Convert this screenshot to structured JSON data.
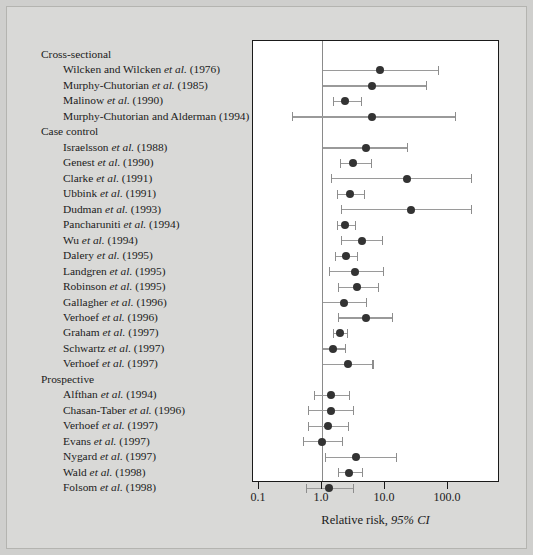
{
  "figure": {
    "background_color": "#d9d9d7",
    "panel_color": "#ffffff",
    "marker_color": "#333333",
    "whisker_color": "#9a9a9a"
  },
  "axis": {
    "title_main": "Relative risk, ",
    "title_italic": "95% CI",
    "ticks": [
      "0.1",
      "1.0",
      "10.0",
      "100.0"
    ],
    "tick_values": [
      0.1,
      1.0,
      10.0,
      100.0
    ],
    "null_value": 1.0
  },
  "chart_data": {
    "type": "scatter",
    "title": "",
    "xlabel": "Relative risk, 95% CI",
    "ylabel": "",
    "scale": "log",
    "xlim": [
      0.1,
      300
    ],
    "xticks": [
      0.1,
      1.0,
      10.0,
      100.0
    ],
    "xticklabels": [
      "0.1",
      "1.0",
      "10.0",
      "100.0"
    ],
    "grid": false,
    "reference_line": 1.0,
    "legend": "none",
    "groups": [
      {
        "name": "Cross-sectional",
        "studies": [
          {
            "label_plain": "Wilcken and Wilcken ",
            "label_italic": "et al.",
            "label_year": " (1976)",
            "estimate": 8.2,
            "ci_low": 1.0,
            "ci_high": 70.0
          },
          {
            "label_plain": "Murphy-Chutorian ",
            "label_italic": "et al.",
            "label_year": " (1985)",
            "estimate": 6.3,
            "ci_low": 1.0,
            "ci_high": 45.0
          },
          {
            "label_plain": "Malinow ",
            "label_italic": "et al.",
            "label_year": " (1990)",
            "estimate": 2.3,
            "ci_low": 1.5,
            "ci_high": 4.2
          },
          {
            "label_plain": "Murphy-Chutorian and Alderman",
            "label_italic": "",
            "label_year": " (1994)",
            "estimate": 6.3,
            "ci_low": 0.33,
            "ci_high": 130.0
          }
        ]
      },
      {
        "name": "Case control",
        "studies": [
          {
            "label_plain": "Israelsson ",
            "label_italic": "et al.",
            "label_year": " (1988)",
            "estimate": 5.0,
            "ci_low": 1.0,
            "ci_high": 22.0
          },
          {
            "label_plain": "Genest ",
            "label_italic": "et al.",
            "label_year": " (1990)",
            "estimate": 3.1,
            "ci_low": 1.9,
            "ci_high": 6.0
          },
          {
            "label_plain": "Clarke ",
            "label_italic": "et al.",
            "label_year": " (1991)",
            "estimate": 22.0,
            "ci_low": 1.4,
            "ci_high": 230.0
          },
          {
            "label_plain": "Ubbink ",
            "label_italic": "et al.",
            "label_year": " (1991)",
            "estimate": 2.8,
            "ci_low": 1.7,
            "ci_high": 4.6
          },
          {
            "label_plain": "Dudman ",
            "label_italic": "et al.",
            "label_year": " (1993)",
            "estimate": 26.0,
            "ci_low": 2.0,
            "ci_high": 230.0
          },
          {
            "label_plain": "Pancharuniti ",
            "label_italic": "et al.",
            "label_year": " (1994)",
            "estimate": 2.3,
            "ci_low": 1.7,
            "ci_high": 3.3
          },
          {
            "label_plain": "Wu ",
            "label_italic": "et al.",
            "label_year": " (1994)",
            "estimate": 4.3,
            "ci_low": 2.0,
            "ci_high": 9.0
          },
          {
            "label_plain": "Dalery ",
            "label_italic": "et al.",
            "label_year": " (1995)",
            "estimate": 2.4,
            "ci_low": 1.6,
            "ci_high": 3.6
          },
          {
            "label_plain": "Landgren ",
            "label_italic": "et al.",
            "label_year": " (1995)",
            "estimate": 3.3,
            "ci_low": 1.3,
            "ci_high": 9.3
          },
          {
            "label_plain": "Robinson ",
            "label_italic": "et al.",
            "label_year": " (1995)",
            "estimate": 3.6,
            "ci_low": 1.8,
            "ci_high": 7.8
          },
          {
            "label_plain": "Gallagher ",
            "label_italic": "et al.",
            "label_year": " (1996)",
            "estimate": 2.2,
            "ci_low": 1.0,
            "ci_high": 5.0
          },
          {
            "label_plain": "Verhoef ",
            "label_italic": "et al.",
            "label_year": " (1996)",
            "estimate": 5.0,
            "ci_low": 1.8,
            "ci_high": 13.0
          },
          {
            "label_plain": "Graham ",
            "label_italic": "et al.",
            "label_year": " (1997)",
            "estimate": 1.9,
            "ci_low": 1.5,
            "ci_high": 2.5
          },
          {
            "label_plain": "Schwartz ",
            "label_italic": "et al.",
            "label_year": " (1997)",
            "estimate": 1.5,
            "ci_low": 1.0,
            "ci_high": 2.3
          },
          {
            "label_plain": "Verhoef ",
            "label_italic": "et al.",
            "label_year": " (1997)",
            "estimate": 2.6,
            "ci_low": 1.0,
            "ci_high": 6.3
          }
        ]
      },
      {
        "name": "Prospective",
        "studies": [
          {
            "label_plain": "Alfthan ",
            "label_italic": "et al.",
            "label_year": " (1994)",
            "estimate": 1.4,
            "ci_low": 0.75,
            "ci_high": 2.7
          },
          {
            "label_plain": "Chasan-Taber ",
            "label_italic": "et al.",
            "label_year": " (1996)",
            "estimate": 1.4,
            "ci_low": 0.6,
            "ci_high": 3.1
          },
          {
            "label_plain": "Verhoef ",
            "label_italic": "et al.",
            "label_year": " (1997)",
            "estimate": 1.25,
            "ci_low": 0.6,
            "ci_high": 2.6
          },
          {
            "label_plain": "Evans ",
            "label_italic": "et al.",
            "label_year": " (1997)",
            "estimate": 1.0,
            "ci_low": 0.5,
            "ci_high": 2.1
          },
          {
            "label_plain": "Nygard ",
            "label_italic": "et al.",
            "label_year": " (1997)",
            "estimate": 3.5,
            "ci_low": 1.1,
            "ci_high": 15.0
          },
          {
            "label_plain": "Wald ",
            "label_italic": "et al.",
            "label_year": " (1998)",
            "estimate": 2.7,
            "ci_low": 1.8,
            "ci_high": 4.3
          },
          {
            "label_plain": "Folsom ",
            "label_italic": "et al.",
            "label_year": " (1998)",
            "estimate": 1.3,
            "ci_low": 0.55,
            "ci_high": 3.1
          }
        ]
      }
    ]
  }
}
